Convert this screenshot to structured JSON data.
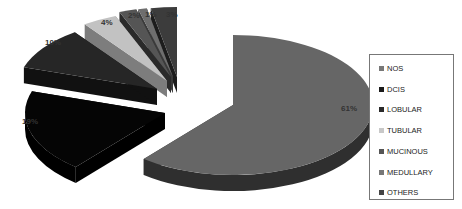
{
  "chart_data": {
    "type": "pie",
    "style": "3d-exploded",
    "title": "",
    "categories": [
      "NOS",
      "DCIS",
      "LOBULAR",
      "TUBULAR",
      "MUCINOUS",
      "MEDULLARY",
      "OTHERS"
    ],
    "values": [
      61,
      19,
      10,
      4,
      2,
      1,
      3
    ],
    "labels": [
      "61%",
      "19%",
      "10%",
      "4%",
      "2%",
      "1%",
      "3%"
    ],
    "colors": [
      "#666666",
      "#050505",
      "#262626",
      "#c2c2c2",
      "#555555",
      "#6e6e6e",
      "#3c3c3c"
    ],
    "side_colors": [
      "#2f2f2f",
      "#000000",
      "#111111",
      "#7d7d7d",
      "#2a2a2a",
      "#3a3a3a",
      "#1c1c1c"
    ],
    "legend_position": "right"
  },
  "legend": {
    "items": [
      {
        "label": "NOS",
        "color": "#777777"
      },
      {
        "label": "DCIS",
        "color": "#1a1a1a"
      },
      {
        "label": "LOBULAR",
        "color": "#2a2a2a"
      },
      {
        "label": "TUBULAR",
        "color": "#c8c8c8"
      },
      {
        "label": "MUCINOUS",
        "color": "#555555"
      },
      {
        "label": "MEDULLARY",
        "color": "#777777"
      },
      {
        "label": "OTHERS",
        "color": "#444444"
      }
    ]
  }
}
